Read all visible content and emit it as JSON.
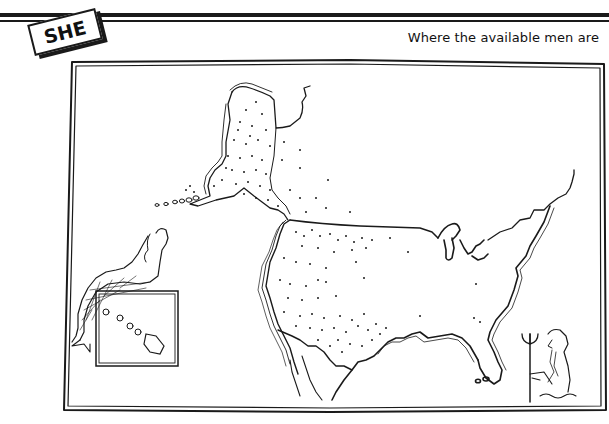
{
  "header": {
    "badge_label": "SHE",
    "caption": "Where the available men are"
  },
  "illustration": {
    "subject": "map of North America with dots marking available men",
    "regions": [
      "alaska",
      "contiguous-united-states",
      "hawaii-inset"
    ],
    "figures": [
      "mermaid",
      "neptune-with-trident"
    ],
    "ink_color": "#1a1a1a",
    "paper_color": "#ffffff"
  }
}
